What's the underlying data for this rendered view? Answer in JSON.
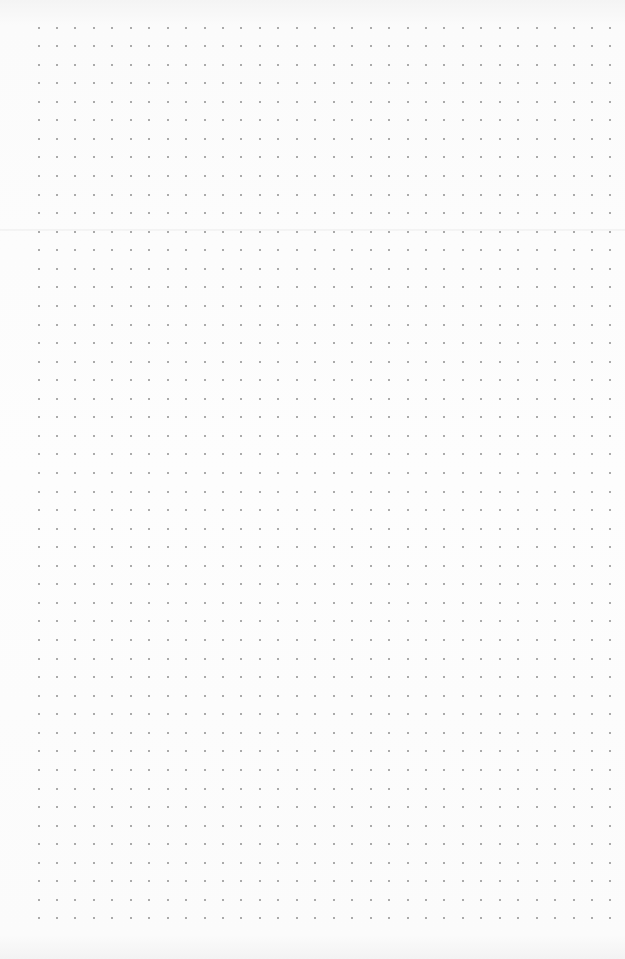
{
  "page": {
    "type": "dot-grid-paper",
    "background_color": "#fcfcfc",
    "dot_color": "#8f8f8f",
    "fold_line_y": 229
  },
  "grid": {
    "columns": 32,
    "rows": 49,
    "origin_x": 38.5,
    "origin_y": 27.5,
    "spacing_x": 18.45,
    "spacing_y": 18.56,
    "dot_size": 2
  }
}
